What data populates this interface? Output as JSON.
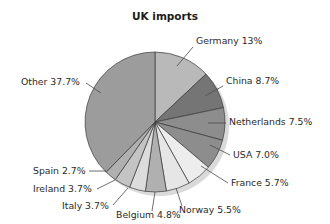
{
  "chart_data": {
    "type": "pie",
    "title": "UK imports",
    "xlabel": "",
    "ylabel": "",
    "legend_position": "none",
    "grid": false,
    "units": "percent",
    "start_angle_deg": 0,
    "direction": "clockwise",
    "categories": [
      "Germany",
      "China",
      "Netherlands",
      "USA",
      "France",
      "Norway",
      "Belgium",
      "Italy",
      "Ireland",
      "Spain",
      "Other"
    ],
    "values": [
      13.0,
      8.7,
      7.5,
      7.0,
      5.7,
      5.5,
      4.8,
      3.7,
      3.7,
      2.7,
      37.7
    ],
    "labels": [
      "Germany 13%",
      "China 8.7%",
      "Netherlands 7.5%",
      "USA 7.0%",
      "France 5.7%",
      "Norway 5.5%",
      "Belgium 4.8%",
      "Italy 3.7%",
      "Ireland 3.7%",
      "Spain 2.7%",
      "Other 37.7%"
    ],
    "slice_colors": [
      "#b9b9b9",
      "#757575",
      "#8d8d8d",
      "#8d8d8d",
      "#ededed",
      "#e6e6e6",
      "#b0b0b0",
      "#dcdcdc",
      "#c4c4c4",
      "#b0b0b0",
      "#9c9c9c"
    ]
  },
  "style": {
    "background": "#ffffff",
    "outline_color": "#3a3a3a",
    "text_color": "#2b2b2b",
    "title_color": "#1b1b1b",
    "leader_color": "#4a4a4a",
    "shadow_color": "#cfcfcf"
  },
  "geometry": {
    "center_x": 155,
    "center_y": 122,
    "radius": 70,
    "title_x": 165,
    "title_y": 20
  },
  "label_layout": [
    {
      "key": "germany",
      "text_x": 196,
      "text_y": 44,
      "anchor": "start",
      "lx1": 193,
      "ly1": 47,
      "lx2": 177,
      "ly2": 66
    },
    {
      "key": "china",
      "text_x": 226,
      "text_y": 84,
      "anchor": "start",
      "lx1": 223,
      "ly1": 86,
      "lx2": 205,
      "ly2": 96
    },
    {
      "key": "netherlands",
      "text_x": 229,
      "text_y": 125,
      "anchor": "start",
      "lx1": 226,
      "ly1": 123,
      "lx2": 208,
      "ly2": 123
    },
    {
      "key": "usa",
      "text_x": 233,
      "text_y": 158,
      "anchor": "start",
      "lx1": 230,
      "ly1": 155,
      "lx2": 210,
      "ly2": 145
    },
    {
      "key": "france",
      "text_x": 231,
      "text_y": 186,
      "anchor": "start",
      "lx1": 228,
      "ly1": 183,
      "lx2": 201,
      "ly2": 166
    },
    {
      "key": "norway",
      "text_x": 179,
      "text_y": 213,
      "anchor": "start",
      "lx1": 182,
      "ly1": 206,
      "lx2": 176,
      "ly2": 188
    },
    {
      "key": "belgium",
      "text_x": 116,
      "text_y": 218,
      "anchor": "start",
      "lx1": 152,
      "ly1": 211,
      "lx2": 155,
      "ly2": 192
    },
    {
      "key": "italy",
      "text_x": 62,
      "text_y": 209,
      "anchor": "start",
      "lx1": 113,
      "ly1": 205,
      "lx2": 128,
      "ly2": 188
    },
    {
      "key": "ireland",
      "text_x": 33,
      "text_y": 192,
      "anchor": "start",
      "lx1": 97,
      "ly1": 189,
      "lx2": 115,
      "ly2": 180
    },
    {
      "key": "spain",
      "text_x": 33,
      "text_y": 174,
      "anchor": "start",
      "lx1": 89,
      "ly1": 171,
      "lx2": 106,
      "ly2": 171
    },
    {
      "key": "other",
      "text_x": 21,
      "text_y": 85,
      "anchor": "start",
      "lx1": 86,
      "ly1": 83,
      "lx2": 101,
      "ly2": 93
    }
  ]
}
